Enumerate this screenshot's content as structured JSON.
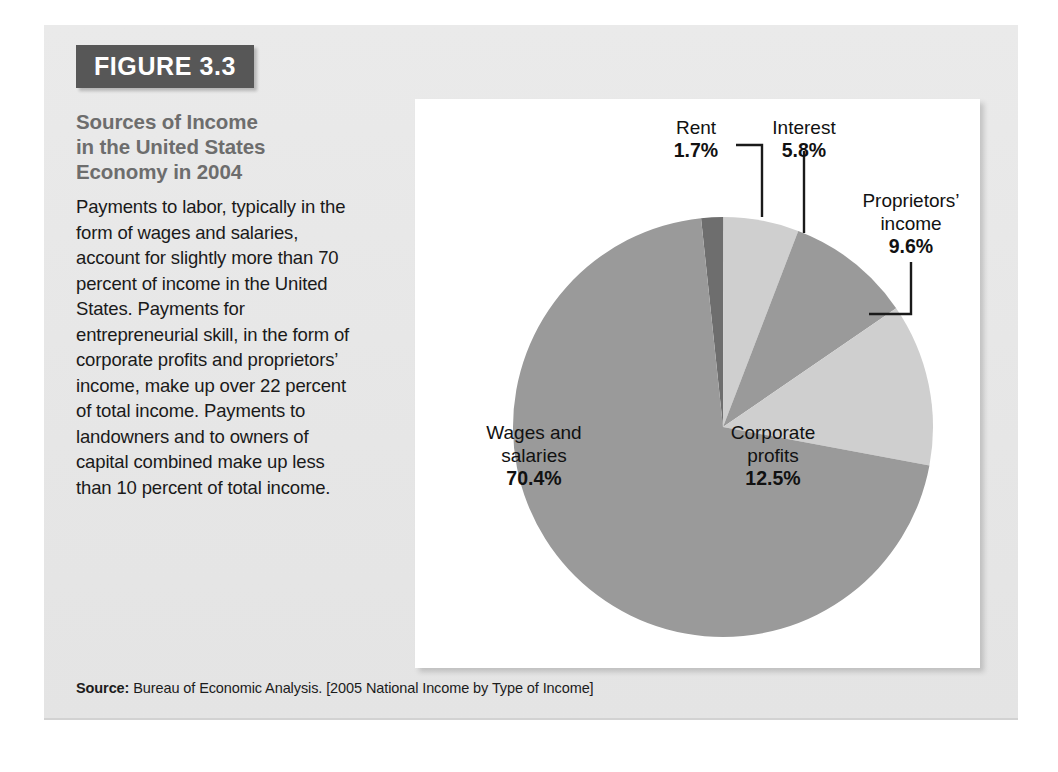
{
  "figure": {
    "badge": "FIGURE 3.3",
    "title": "Sources of Income in the United States Economy in 2004",
    "title_lines": [
      "Sources of Income",
      "in the United States",
      "Economy in 2004"
    ],
    "description": "Payments to labor, typically in the form of wages and salaries, account for slightly more than 70 percent of income in the United States. Payments for entrepreneurial skill, in the form of corporate profits and proprietors’ income, make up over 22 percent of total income. Payments to landowners and to owners of capital combined make up less than 10 percent of total income.",
    "source_label": "Source:",
    "source_text": " Bureau of Economic Analysis. [2005 National Income by Type of Income]"
  },
  "labels": {
    "rent": {
      "name": "Rent",
      "value": "1.7%"
    },
    "interest": {
      "name": "Interest",
      "value": "5.8%"
    },
    "proprietors": {
      "name_line1": "Proprietors’",
      "name_line2": "income",
      "value": "9.6%"
    },
    "corporate": {
      "name_line1": "Corporate",
      "name_line2": "profits",
      "value": "12.5%"
    },
    "wages": {
      "name_line1": "Wages and",
      "name_line2": "salaries",
      "value": "70.4%"
    }
  },
  "colors": {
    "card_background": "#e8e8e8",
    "badge_background": "#575757",
    "title_text": "#6d6d6d",
    "body_text": "#1a1a1a",
    "panel_background": "#ffffff",
    "slice_medium_gray": "#9a9a9a",
    "slice_dark_gray": "#6e6e6e",
    "slice_light_gray": "#cfcfcf",
    "leader_line": "#1a1a1a"
  },
  "chart_data": {
    "type": "pie",
    "title": "Sources of Income in the United States Economy in 2004",
    "units": "percent of total income",
    "legend_position": "none (direct labels with leader lines)",
    "start_angle_deg": -6,
    "direction": "clockwise",
    "categories": [
      "Rent",
      "Interest",
      "Proprietors' income",
      "Corporate profits",
      "Wages and salaries"
    ],
    "values": [
      1.7,
      5.8,
      9.6,
      12.5,
      70.4
    ],
    "slice_colors": [
      "#6e6e6e",
      "#cfcfcf",
      "#9a9a9a",
      "#cfcfcf",
      "#9a9a9a"
    ],
    "labels": [
      "1.7%",
      "5.8%",
      "9.6%",
      "12.5%",
      "70.4%"
    ],
    "total": 100.0,
    "annotations": [
      "Rent 1.7% — external label with elbow leader line",
      "Interest 5.8% — external label with vertical leader line",
      "Proprietors’ income 9.6% — external label with elbow leader line",
      "Corporate profits 12.5% — label inside slice",
      "Wages and salaries 70.4% — label inside slice"
    ]
  }
}
